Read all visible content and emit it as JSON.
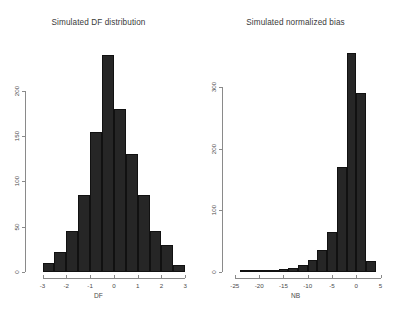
{
  "figure": {
    "background": "#ffffff",
    "bar_color": "#262626",
    "axis_color": "#8a8a8a",
    "text_color": "#4a4a4a"
  },
  "panels": [
    {
      "name": "df-panel",
      "title": "Simulated DF distribution",
      "xlabel": "DF",
      "ylabel": "",
      "xticks": [
        "-3",
        "-2",
        "-1",
        "0",
        "1",
        "2",
        "3"
      ],
      "yticks": [
        "0",
        "50",
        "100",
        "150",
        "200"
      ]
    },
    {
      "name": "nb-panel",
      "title": "Simulated normalized bias",
      "xlabel": "NB",
      "ylabel": "",
      "xticks": [
        "-25",
        "-20",
        "-15",
        "-10",
        "-5",
        "0",
        "5"
      ],
      "yticks": [
        "0",
        "100",
        "200",
        "300"
      ]
    }
  ],
  "chart_data": [
    {
      "type": "bar",
      "title": "Simulated DF distribution",
      "xlabel": "DF",
      "ylabel": "",
      "subtitle": "",
      "grid": false,
      "legend": "none",
      "xlim": [
        -3.4,
        3.2
      ],
      "ylim": [
        0,
        245
      ],
      "xticks": [
        -3,
        -2,
        -1,
        0,
        1,
        2,
        3
      ],
      "yticks": [
        0,
        50,
        100,
        150,
        200
      ],
      "bin_width": 0.5,
      "bin_edges": [
        -3.0,
        -2.5,
        -2.0,
        -1.5,
        -1.0,
        -0.5,
        0.0,
        0.5,
        1.0,
        1.5,
        2.0,
        2.5,
        3.0
      ],
      "categories": [
        "-3.0",
        "-2.5",
        "-2.0",
        "-1.5",
        "-1.0",
        "-0.5",
        "0.0",
        "0.5",
        "1.0",
        "1.5",
        "2.0",
        "2.5"
      ],
      "values": [
        10,
        22,
        45,
        85,
        155,
        240,
        180,
        130,
        85,
        45,
        30,
        8
      ]
    },
    {
      "type": "bar",
      "title": "Simulated normalized bias",
      "xlabel": "NB",
      "ylabel": "",
      "subtitle": "",
      "grid": false,
      "legend": "none",
      "xlim": [
        -26,
        5.5
      ],
      "ylim": [
        0,
        360
      ],
      "xticks": [
        -25,
        -20,
        -15,
        -10,
        -5,
        0,
        5
      ],
      "yticks": [
        0,
        100,
        200,
        300
      ],
      "bin_width": 2,
      "bin_edges": [
        -24,
        -22,
        -20,
        -18,
        -16,
        -14,
        -12,
        -10,
        -8,
        -6,
        -4,
        -2,
        0,
        2,
        4
      ],
      "categories": [
        "-24",
        "-22",
        "-20",
        "-18",
        "-16",
        "-14",
        "-12",
        "-10",
        "-8",
        "-6",
        "-4",
        "-2",
        "0",
        "2"
      ],
      "values": [
        2,
        3,
        4,
        4,
        5,
        6,
        12,
        20,
        35,
        65,
        170,
        355,
        290,
        18
      ]
    }
  ]
}
